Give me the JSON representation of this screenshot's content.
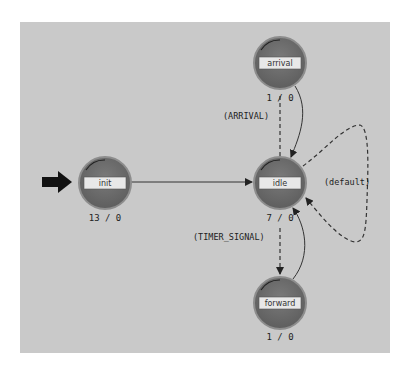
{
  "diagram": {
    "type": "state-machine",
    "background": "#c9c9c9",
    "colors": {
      "state_fill": "#6f6f6f",
      "state_border": "#8a8a8a",
      "label_box": "#e6e6e6",
      "edge": "#333333"
    },
    "states": [
      {
        "id": "init",
        "label": "init",
        "count": "13 / 0",
        "initial": true
      },
      {
        "id": "idle",
        "label": "idle",
        "count": "7 / 0"
      },
      {
        "id": "arrival",
        "label": "arrival",
        "count": "1 / 0"
      },
      {
        "id": "forward",
        "label": "forward",
        "count": "1 / 0"
      }
    ],
    "transitions": [
      {
        "from": "init",
        "to": "idle",
        "label": "",
        "style": "solid"
      },
      {
        "from": "idle",
        "to": "arrival",
        "label": "(ARRIVAL)",
        "style": "dashed"
      },
      {
        "from": "arrival",
        "to": "idle",
        "label": "",
        "style": "solid"
      },
      {
        "from": "idle",
        "to": "forward",
        "label": "(TIMER_SIGNAL)",
        "style": "dashed"
      },
      {
        "from": "forward",
        "to": "idle",
        "label": "",
        "style": "solid"
      },
      {
        "from": "idle",
        "to": "idle",
        "label": "(default)",
        "style": "dashed"
      }
    ]
  }
}
